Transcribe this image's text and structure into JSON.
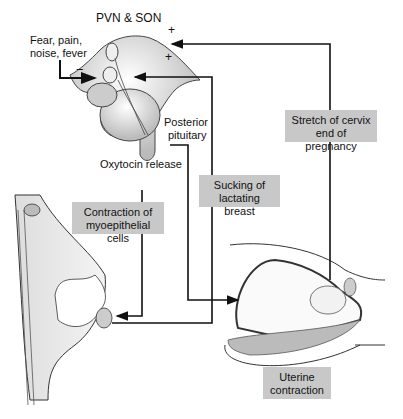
{
  "diagram": {
    "labels": {
      "nuclei": "PVN & SON",
      "inhibitors": [
        "Fear, pain,",
        "noise, fever"
      ],
      "minus": "−",
      "plus_top": "+",
      "plus_bottom": "+",
      "posterior_pituitary": [
        "Posterior",
        "pituitary"
      ],
      "oxytocin_release": "Oxytocin release"
    },
    "boxes": {
      "myoepithelial": [
        "Contraction of",
        "myoepithelial cells"
      ],
      "sucking": [
        "Sucking of",
        "lactating breast"
      ],
      "cervix": [
        "Stretch of cervix",
        "end of pregnancy"
      ],
      "uterine": [
        "Uterine",
        "contraction"
      ]
    },
    "colors": {
      "box_fill": "#c8c8c8",
      "line": "#111111"
    }
  }
}
